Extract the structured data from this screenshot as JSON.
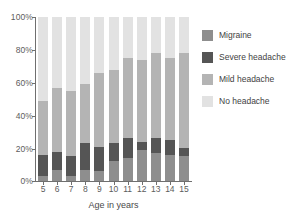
{
  "chart_data": {
    "type": "bar",
    "stacked": true,
    "stack_percent": true,
    "title": "",
    "subtitle": "",
    "xlabel": "Age in years",
    "ylabel": "",
    "categories": [
      "5",
      "6",
      "7",
      "8",
      "9",
      "10",
      "11",
      "12",
      "13",
      "14",
      "15"
    ],
    "ylim": [
      0,
      100
    ],
    "ytick_labels": [
      "0%",
      "20%",
      "40%",
      "60%",
      "80%",
      "100%"
    ],
    "ytick_values": [
      0,
      20,
      40,
      60,
      80,
      100
    ],
    "grid": false,
    "legend_position": "right",
    "series": [
      {
        "name": "Migraine",
        "color": "#8e8e8e",
        "values": [
          3,
          7,
          3,
          7,
          6,
          12,
          14,
          19,
          17,
          16,
          15
        ]
      },
      {
        "name": "Severe headache",
        "color": "#555555",
        "values": [
          13,
          11,
          12,
          16,
          15,
          11,
          12,
          5,
          9,
          9,
          5
        ]
      },
      {
        "name": "Mild headache",
        "color": "#b4b4b4",
        "values": [
          33,
          39,
          40,
          36,
          45,
          45,
          49,
          50,
          52,
          50,
          58
        ]
      },
      {
        "name": "No headache",
        "color": "#e2e2e2",
        "values": [
          51,
          43,
          45,
          41,
          34,
          32,
          25,
          26,
          22,
          25,
          22
        ]
      }
    ],
    "cumulative_tops": {
      "migraine": [
        3,
        7,
        3,
        7,
        6,
        12,
        14,
        19,
        17,
        16,
        15
      ],
      "severe": [
        16,
        18,
        15,
        23,
        21,
        23,
        26,
        24,
        26,
        25,
        20
      ],
      "mild": [
        49,
        57,
        55,
        59,
        66,
        68,
        75,
        74,
        78,
        75,
        78
      ],
      "none": [
        100,
        100,
        100,
        100,
        100,
        100,
        100,
        100,
        100,
        100,
        100
      ]
    }
  },
  "legend": {
    "items": [
      {
        "label": "Migraine",
        "color": "#8e8e8e"
      },
      {
        "label": "Severe headache",
        "color": "#555555"
      },
      {
        "label": "Mild headache",
        "color": "#b4b4b4"
      },
      {
        "label": "No headache",
        "color": "#e2e2e2"
      }
    ]
  },
  "axes": {
    "x_title": "Age in years",
    "y_ticks": [
      "100%",
      "80%",
      "60%",
      "40%",
      "20%",
      "0%"
    ],
    "x_ticks": [
      "5",
      "6",
      "7",
      "8",
      "9",
      "10",
      "11",
      "12",
      "13",
      "14",
      "15"
    ]
  }
}
